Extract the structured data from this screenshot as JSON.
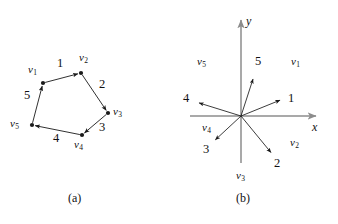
{
  "figure": {
    "background": "#ffffff",
    "ink": "#1a1a1a",
    "axis_color": "#8c8c8c",
    "panels": [
      {
        "id": "a",
        "caption": "(a)",
        "kind": "directed-polygon",
        "vertices": [
          {
            "name": "v",
            "sub": "1",
            "x": 43,
            "y": 83,
            "label_x": 28,
            "label_y": 64
          },
          {
            "name": "v",
            "sub": "2",
            "x": 81,
            "y": 73,
            "label_x": 79,
            "label_y": 52
          },
          {
            "name": "v",
            "sub": "3",
            "x": 108,
            "y": 113,
            "label_x": 113,
            "label_y": 106
          },
          {
            "name": "v",
            "sub": "4",
            "x": 82,
            "y": 135,
            "label_x": 74,
            "label_y": 139
          },
          {
            "name": "v",
            "sub": "5",
            "x": 32,
            "y": 125,
            "label_x": 10,
            "label_y": 118
          }
        ],
        "edges": [
          {
            "label": "1",
            "from": 0,
            "to": 1,
            "label_x": 57,
            "label_y": 57
          },
          {
            "label": "2",
            "from": 1,
            "to": 2,
            "label_x": 99,
            "label_y": 78
          },
          {
            "label": "3",
            "from": 2,
            "to": 3,
            "label_x": 99,
            "label_y": 121
          },
          {
            "label": "4",
            "from": 3,
            "to": 4,
            "label_x": 53,
            "label_y": 132
          },
          {
            "label": "5",
            "from": 4,
            "to": 0,
            "label_x": 24,
            "label_y": 89
          }
        ]
      },
      {
        "id": "b",
        "caption": "(b)",
        "kind": "vector-diagram",
        "origin": {
          "x": 241,
          "y": 116
        },
        "axes": [
          {
            "name": "x",
            "label": "x",
            "x1": 190,
            "y1": 116,
            "x2": 316,
            "y2": 116,
            "label_x": 312,
            "label_y": 121
          },
          {
            "name": "y",
            "label": "y",
            "x1": 241,
            "y1": 163,
            "x2": 241,
            "y2": 20,
            "label_x": 246,
            "label_y": 15
          }
        ],
        "vectors": [
          {
            "label": "1",
            "tip_x": 283,
            "tip_y": 99,
            "label_x": 288,
            "label_y": 92
          },
          {
            "label": "2",
            "tip_x": 273,
            "tip_y": 155,
            "label_x": 274,
            "label_y": 157
          },
          {
            "label": "3",
            "tip_x": 213,
            "tip_y": 142,
            "label_x": 203,
            "label_y": 143
          },
          {
            "label": "4",
            "tip_x": 196,
            "tip_y": 102,
            "label_x": 183,
            "label_y": 92
          },
          {
            "label": "5",
            "tip_x": 254,
            "tip_y": 76,
            "label_x": 255,
            "label_y": 55
          }
        ],
        "regions": [
          {
            "name": "v",
            "sub": "1",
            "label_x": 291,
            "label_y": 56
          },
          {
            "name": "v",
            "sub": "2",
            "label_x": 290,
            "label_y": 137
          },
          {
            "name": "v",
            "sub": "3",
            "label_x": 236,
            "label_y": 170
          },
          {
            "name": "v",
            "sub": "4",
            "label_x": 202,
            "label_y": 122
          },
          {
            "name": "v",
            "sub": "5",
            "label_x": 197,
            "label_y": 56
          }
        ]
      }
    ],
    "captions": [
      {
        "text": "(a)",
        "x": 68,
        "y": 192
      },
      {
        "text": "(b)",
        "x": 236,
        "y": 192
      }
    ]
  }
}
